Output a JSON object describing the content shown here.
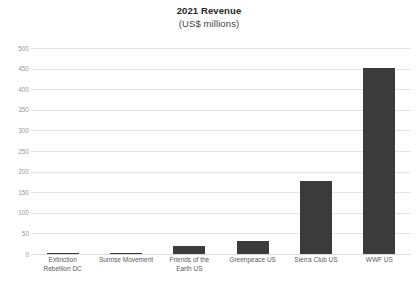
{
  "chart_data": {
    "type": "bar",
    "title": "2021 Revenue",
    "subtitle": "(US$ millions)",
    "xlabel": "",
    "ylabel": "",
    "ylim": [
      0,
      500
    ],
    "ytick_step": 50,
    "yticks": [
      500,
      450,
      400,
      350,
      300,
      250,
      200,
      150,
      100,
      50,
      0
    ],
    "grid": true,
    "legend": false,
    "legend_position": "none",
    "bar_color": "#3b3b3b",
    "gridline_color": "#e4e4e4",
    "tick_label_color": "#9a9a9a",
    "categories": [
      "Extinction Rebellion DC",
      "Sunrise Movement",
      "Friends of the Earth US",
      "Greenpeace US",
      "Sierra Club US",
      "WWF US"
    ],
    "values": [
      2,
      3,
      19,
      31,
      178,
      452
    ]
  }
}
